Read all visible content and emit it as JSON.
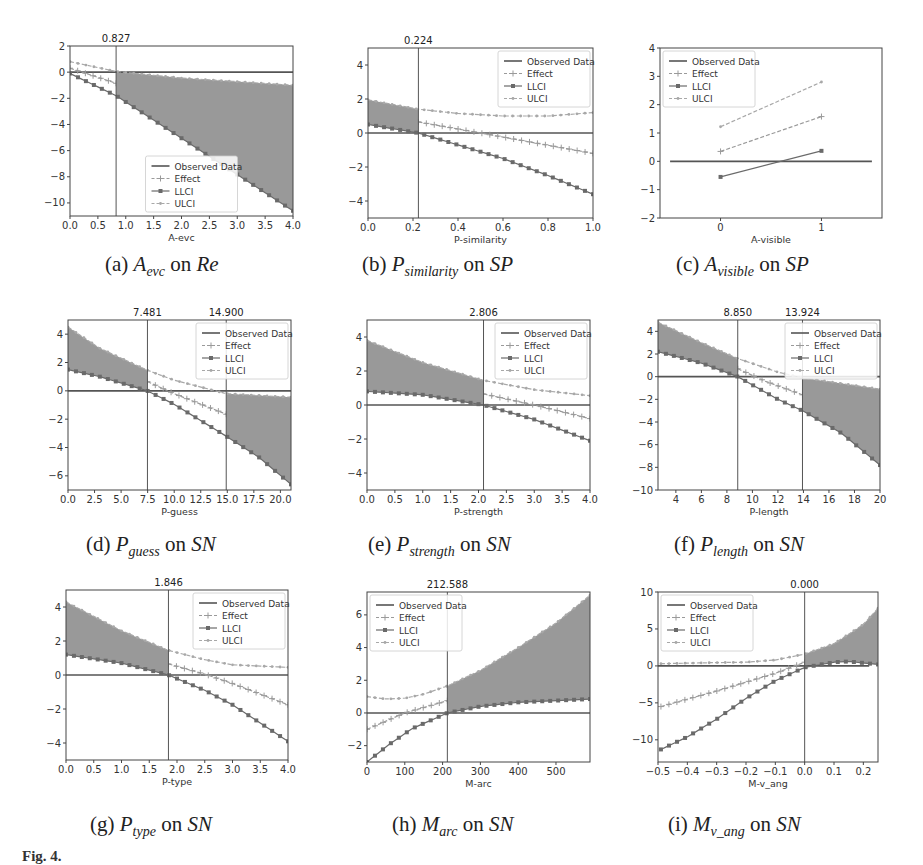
{
  "figure_label": "Fig. 4.",
  "legend_labels": [
    "Observed Data",
    "Effect",
    "LLCI",
    "ULCI"
  ],
  "colors": {
    "shade": "#8e8e8e",
    "effect": "#9a9a9a",
    "llci": "#6a6a6a",
    "ulci": "#a8a8a8",
    "observed": "#555555",
    "axis": "#444444"
  },
  "chart_data": [
    {
      "id": "a",
      "type": "line",
      "caption": {
        "label": "(a)",
        "var": "A",
        "sub": "evc",
        "target": "Re"
      },
      "xlabel": "A-evc",
      "ylabel": "",
      "xlim": [
        0,
        4
      ],
      "ylim": [
        -11,
        2
      ],
      "xticks": [
        0.0,
        0.5,
        1.0,
        1.5,
        2.0,
        2.5,
        3.0,
        3.5,
        4.0
      ],
      "yticks": [
        2,
        0,
        -2,
        -4,
        -6,
        -8,
        -10
      ],
      "xticklabels": [
        "0.0",
        "0.5",
        "1.0",
        "1.5",
        "2.0",
        "2.5",
        "3.0",
        "3.5",
        "4.0"
      ],
      "thresholds": [
        0.827
      ],
      "threshold_labels": [
        "0.827"
      ],
      "shade": [
        [
          0.827,
          4.0
        ]
      ],
      "legend_pos": "lower center",
      "observed": [
        [
          0,
          0
        ],
        [
          4,
          0
        ]
      ],
      "series": [
        {
          "name": "Effect",
          "x": [
            0,
            0.827
          ],
          "y": [
            0.3,
            -0.85
          ]
        },
        {
          "name": "LLCI",
          "x": [
            0,
            0.827,
            4.0
          ],
          "y": [
            -0.1,
            -1.8,
            -10.6
          ]
        },
        {
          "name": "ULCI",
          "x": [
            0,
            0.827,
            2,
            4.0
          ],
          "y": [
            0.8,
            0.05,
            -0.45,
            -1.0
          ]
        }
      ]
    },
    {
      "id": "b",
      "type": "line",
      "caption": {
        "label": "(b)",
        "var": "P",
        "sub": "similarity",
        "target": "SP"
      },
      "xlabel": "P-similarity",
      "ylabel": "",
      "xlim": [
        0,
        1
      ],
      "ylim": [
        -5,
        5
      ],
      "xticks": [
        0.0,
        0.2,
        0.4,
        0.6,
        0.8,
        1.0
      ],
      "yticks": [
        4,
        2,
        0,
        -2,
        -4
      ],
      "xticklabels": [
        "0.0",
        "0.2",
        "0.4",
        "0.6",
        "0.8",
        "1.0"
      ],
      "thresholds": [
        0.224
      ],
      "threshold_labels": [
        "0.224"
      ],
      "shade": [
        [
          0.0,
          0.224
        ]
      ],
      "legend_pos": "upper right",
      "observed": [
        [
          0,
          0
        ],
        [
          1,
          0
        ]
      ],
      "series": [
        {
          "name": "Effect",
          "x": [
            0.224,
            0.5,
            1.0
          ],
          "y": [
            0.65,
            0.0,
            -1.2
          ]
        },
        {
          "name": "LLCI",
          "x": [
            0,
            0.224,
            0.4,
            0.6,
            0.8,
            1.0
          ],
          "y": [
            0.5,
            0.0,
            -0.7,
            -1.5,
            -2.5,
            -3.6
          ]
        },
        {
          "name": "ULCI",
          "x": [
            0,
            0.224,
            0.4,
            0.6,
            0.8,
            1.0
          ],
          "y": [
            1.95,
            1.4,
            1.15,
            1.0,
            1.0,
            1.2
          ]
        }
      ]
    },
    {
      "id": "c",
      "type": "line",
      "caption": {
        "label": "(c)",
        "var": "A",
        "sub": "visible",
        "target": "SP"
      },
      "xlabel": "A-visible",
      "ylabel": "",
      "xlim": [
        -0.6,
        1.6
      ],
      "ylim": [
        -2,
        4
      ],
      "xticks": [
        0,
        1
      ],
      "yticks": [
        4,
        3,
        2,
        1,
        0,
        -1,
        -2
      ],
      "xticklabels": [
        "0",
        "1"
      ],
      "thresholds": [],
      "threshold_labels": [],
      "shade": [],
      "legend_pos": "upper left",
      "observed": [
        [
          -0.5,
          0
        ],
        [
          1.5,
          0
        ]
      ],
      "series": [
        {
          "name": "Effect",
          "x": [
            0,
            1
          ],
          "y": [
            0.35,
            1.58
          ]
        },
        {
          "name": "LLCI",
          "x": [
            0,
            1
          ],
          "y": [
            -0.55,
            0.37
          ]
        },
        {
          "name": "ULCI",
          "x": [
            0,
            1
          ],
          "y": [
            1.22,
            2.8
          ]
        }
      ]
    },
    {
      "id": "d",
      "type": "line",
      "caption": {
        "label": "(d)",
        "var": "P",
        "sub": "guess",
        "target": "SN"
      },
      "xlabel": "P-guess",
      "ylabel": "",
      "xlim": [
        0,
        21
      ],
      "ylim": [
        -7,
        5
      ],
      "xticks": [
        0,
        2.5,
        5,
        7.5,
        10,
        12.5,
        15,
        17.5,
        20
      ],
      "yticks": [
        4,
        2,
        0,
        -2,
        -4,
        -6
      ],
      "xticklabels": [
        "0.0",
        "2.5",
        "5.0",
        "7.5",
        "10.0",
        "12.5",
        "15.0",
        "17.5",
        "20.0"
      ],
      "thresholds": [
        7.481,
        14.9
      ],
      "threshold_labels": [
        "7.481",
        "14.900"
      ],
      "shade": [
        [
          0,
          7.481
        ],
        [
          14.9,
          21
        ]
      ],
      "legend_pos": "upper right",
      "observed": [
        [
          0,
          0
        ],
        [
          21,
          0
        ]
      ],
      "series": [
        {
          "name": "Effect",
          "x": [
            7.481,
            10,
            14.9
          ],
          "y": [
            0.65,
            -0.2,
            -1.65
          ]
        },
        {
          "name": "LLCI",
          "x": [
            0,
            3,
            7.481,
            10,
            14.9,
            18,
            21
          ],
          "y": [
            1.5,
            1.0,
            0.0,
            -0.95,
            -3.2,
            -4.7,
            -6.6
          ]
        },
        {
          "name": "ULCI",
          "x": [
            0,
            3,
            7.481,
            10,
            14.9,
            21
          ],
          "y": [
            4.5,
            3.0,
            1.45,
            0.75,
            -0.2,
            -0.45
          ]
        }
      ]
    },
    {
      "id": "e",
      "type": "line",
      "caption": {
        "label": "(e)",
        "var": "P",
        "sub": "strength",
        "target": "SN"
      },
      "xlabel": "P-strength",
      "ylabel": "",
      "xlim": [
        0,
        4
      ],
      "ylim": [
        -5,
        5
      ],
      "xticks": [
        0,
        0.5,
        1,
        1.5,
        2,
        2.5,
        3,
        3.5,
        4
      ],
      "yticks": [
        4,
        2,
        0,
        -2,
        -4
      ],
      "xticklabels": [
        "0.0",
        "0.5",
        "1.0",
        "1.5",
        "2.0",
        "2.5",
        "3.0",
        "3.5",
        "4.0"
      ],
      "thresholds": [
        2.09
      ],
      "threshold_labels": [
        "2.806"
      ],
      "shade": [
        [
          0,
          2.09
        ]
      ],
      "legend_pos": "upper right",
      "observed": [
        [
          0,
          0
        ],
        [
          4,
          0
        ]
      ],
      "series": [
        {
          "name": "Effect",
          "x": [
            2.09,
            3.0,
            4.0
          ],
          "y": [
            0.65,
            0.0,
            -0.8
          ]
        },
        {
          "name": "LLCI",
          "x": [
            0,
            1.0,
            2.09,
            3.0,
            4.0
          ],
          "y": [
            0.8,
            0.6,
            0.0,
            -0.85,
            -2.1
          ]
        },
        {
          "name": "ULCI",
          "x": [
            0,
            1.0,
            2.09,
            3.0,
            4.0
          ],
          "y": [
            3.8,
            2.5,
            1.45,
            0.9,
            0.55
          ]
        }
      ]
    },
    {
      "id": "f",
      "type": "line",
      "caption": {
        "label": "(f)",
        "var": "P",
        "sub": "length",
        "target": "SN"
      },
      "xlabel": "P-length",
      "ylabel": "",
      "xlim": [
        2.6,
        20
      ],
      "ylim": [
        -10,
        5
      ],
      "xticks": [
        4,
        6,
        8,
        10,
        12,
        14,
        16,
        18,
        20
      ],
      "yticks": [
        4,
        2,
        0,
        -2,
        -4,
        -6,
        -8,
        -10
      ],
      "xticklabels": [
        "4",
        "6",
        "8",
        "10",
        "12",
        "14",
        "16",
        "18",
        "20"
      ],
      "thresholds": [
        8.85,
        13.924
      ],
      "threshold_labels": [
        "8.850",
        "13.924"
      ],
      "shade": [
        [
          2.6,
          8.85
        ],
        [
          13.924,
          20
        ]
      ],
      "legend_pos": "upper right",
      "observed": [
        [
          2.6,
          0
        ],
        [
          20,
          0
        ]
      ],
      "series": [
        {
          "name": "Effect",
          "x": [
            8.85,
            11,
            13.924
          ],
          "y": [
            0.7,
            -0.4,
            -1.6
          ]
        },
        {
          "name": "LLCI",
          "x": [
            2.6,
            6,
            8.85,
            12,
            13.924,
            17,
            20
          ],
          "y": [
            2.2,
            1.2,
            0.0,
            -2.0,
            -3.0,
            -5.0,
            -7.8
          ]
        },
        {
          "name": "ULCI",
          "x": [
            2.6,
            6,
            8.85,
            12,
            13.924,
            20
          ],
          "y": [
            4.8,
            3.0,
            1.6,
            0.4,
            -0.1,
            -1.1
          ]
        }
      ]
    },
    {
      "id": "g",
      "type": "line",
      "caption": {
        "label": "(g)",
        "var": "P",
        "sub": "type",
        "target": "SN"
      },
      "xlabel": "P-type",
      "ylabel": "",
      "xlim": [
        0,
        4
      ],
      "ylim": [
        -5,
        5
      ],
      "xticks": [
        0,
        0.5,
        1,
        1.5,
        2,
        2.5,
        3,
        3.5,
        4
      ],
      "yticks": [
        4,
        2,
        0,
        -2,
        -4
      ],
      "xticklabels": [
        "0.0",
        "0.5",
        "1.0",
        "1.5",
        "2.0",
        "2.5",
        "3.0",
        "3.5",
        "4.0"
      ],
      "thresholds": [
        1.846
      ],
      "threshold_labels": [
        "1.846"
      ],
      "shade": [
        [
          0,
          1.846
        ]
      ],
      "legend_pos": "upper right",
      "observed": [
        [
          0,
          0
        ],
        [
          4,
          0
        ]
      ],
      "series": [
        {
          "name": "Effect",
          "x": [
            1.846,
            2.5,
            3.0,
            4.0
          ],
          "y": [
            0.65,
            0.05,
            -0.5,
            -1.75
          ]
        },
        {
          "name": "LLCI",
          "x": [
            0,
            1.0,
            1.846,
            2.5,
            3.0,
            4.0
          ],
          "y": [
            1.2,
            0.7,
            0.0,
            -0.9,
            -1.75,
            -3.9
          ]
        },
        {
          "name": "ULCI",
          "x": [
            0,
            1.0,
            1.846,
            2.5,
            3.0,
            4.0
          ],
          "y": [
            4.3,
            2.6,
            1.45,
            0.9,
            0.6,
            0.45
          ]
        }
      ]
    },
    {
      "id": "h",
      "type": "line",
      "caption": {
        "label": "(h)",
        "var": "M",
        "sub": "arc",
        "target": "SN"
      },
      "xlabel": "M-arc",
      "ylabel": "",
      "xlim": [
        0,
        590
      ],
      "ylim": [
        -3,
        7.4
      ],
      "xticks": [
        0,
        100,
        200,
        300,
        400,
        500
      ],
      "yticks": [
        6,
        4,
        2,
        0,
        -2
      ],
      "xticklabels": [
        "0",
        "100",
        "200",
        "300",
        "400",
        "500"
      ],
      "thresholds": [
        212.588
      ],
      "threshold_labels": [
        "212.588"
      ],
      "shade": [
        [
          212.588,
          590
        ]
      ],
      "legend_pos": "upper left",
      "observed": [
        [
          0,
          0
        ],
        [
          590,
          0
        ]
      ],
      "series": [
        {
          "name": "Effect",
          "x": [
            0,
            100,
            212.588
          ],
          "y": [
            -1.0,
            0.0,
            0.75
          ]
        },
        {
          "name": "LLCI",
          "x": [
            0,
            60,
            120,
            212.588,
            300,
            400,
            590
          ],
          "y": [
            -3.0,
            -1.9,
            -0.95,
            0.0,
            0.4,
            0.65,
            0.85
          ]
        },
        {
          "name": "ULCI",
          "x": [
            0,
            50,
            100,
            150,
            212.588,
            300,
            400,
            500,
            590
          ],
          "y": [
            1.0,
            0.85,
            0.9,
            1.15,
            1.65,
            2.6,
            4.0,
            5.5,
            7.2
          ]
        }
      ]
    },
    {
      "id": "i",
      "type": "line",
      "caption": {
        "label": "(i)",
        "var": "M",
        "sub": "v_ang",
        "target": "SN"
      },
      "xlabel": "M-v_ang",
      "ylabel": "",
      "xlim": [
        -0.5,
        0.25
      ],
      "ylim": [
        -13,
        10
      ],
      "xticks": [
        -0.5,
        -0.4,
        -0.3,
        -0.2,
        -0.1,
        0.0,
        0.1,
        0.2
      ],
      "yticks": [
        10,
        5,
        0,
        -5,
        -10
      ],
      "xticklabels": [
        "−0.5",
        "−0.4",
        "−0.3",
        "−0.2",
        "−0.1",
        "0.0",
        "0.1",
        "0.2"
      ],
      "thresholds": [
        0.0
      ],
      "threshold_labels": [
        "0.000"
      ],
      "shade": [
        [
          0.0,
          0.25
        ]
      ],
      "legend_pos": "upper left",
      "observed": [
        [
          -0.5,
          0
        ],
        [
          0.22,
          0
        ]
      ],
      "series": [
        {
          "name": "Effect",
          "x": [
            -0.49,
            -0.4,
            -0.3,
            -0.2,
            -0.1,
            0.0
          ],
          "y": [
            -5.5,
            -4.5,
            -3.4,
            -2.2,
            -1.0,
            0.5
          ]
        },
        {
          "name": "LLCI",
          "x": [
            -0.49,
            -0.4,
            -0.3,
            -0.2,
            -0.1,
            0.0,
            0.1,
            0.15,
            0.25
          ],
          "y": [
            -11.3,
            -9.6,
            -7.2,
            -4.4,
            -2.0,
            -0.2,
            0.5,
            0.6,
            0.2
          ]
        },
        {
          "name": "ULCI",
          "x": [
            -0.49,
            -0.3,
            -0.2,
            -0.1,
            0.0,
            0.1,
            0.2,
            0.25
          ],
          "y": [
            0.3,
            0.45,
            0.5,
            0.8,
            1.6,
            3.0,
            5.6,
            7.8
          ]
        }
      ]
    }
  ]
}
